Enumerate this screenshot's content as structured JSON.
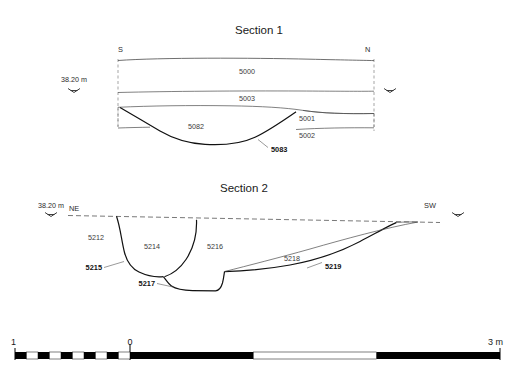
{
  "figure": {
    "kind": "archaeological-section-drawing",
    "sections": [
      {
        "title": "Section 1",
        "datum_label": "38.20 m",
        "left_orientation": "S",
        "right_orientation": "N",
        "deposits": [
          "5000",
          "5003",
          "5001",
          "5002",
          "5082"
        ],
        "cuts": [
          "5083"
        ],
        "labels": [
          {
            "text": "5000",
            "type": "deposit"
          },
          {
            "text": "5003",
            "type": "deposit"
          },
          {
            "text": "5001",
            "type": "deposit"
          },
          {
            "text": "5002",
            "type": "deposit"
          },
          {
            "text": "5082",
            "type": "deposit"
          },
          {
            "text": "5083",
            "type": "cut"
          }
        ]
      },
      {
        "title": "Section 2",
        "datum_label": "38.20 m",
        "left_orientation": "NE",
        "right_orientation": "SW",
        "deposits": [
          "5212",
          "5214",
          "5216",
          "5218"
        ],
        "cuts": [
          "5215",
          "5217",
          "5219"
        ],
        "labels": [
          {
            "text": "5212",
            "type": "deposit"
          },
          {
            "text": "5214",
            "type": "deposit"
          },
          {
            "text": "5216",
            "type": "deposit"
          },
          {
            "text": "5218",
            "type": "deposit"
          },
          {
            "text": "5215",
            "type": "cut"
          },
          {
            "text": "5217",
            "type": "cut"
          },
          {
            "text": "5219",
            "type": "cut"
          }
        ]
      }
    ],
    "scale_bar": {
      "left_label": "1",
      "zero_label": "0",
      "right_label": "3 m",
      "unit": "m",
      "total_span_m": 4,
      "subdivided_span_m": 1,
      "subdivision_count": 10
    },
    "colors": {
      "ink": "#111111",
      "deposit_stroke": "#4a4a4a",
      "datum_stroke": "#555555",
      "background": "#ffffff"
    }
  }
}
